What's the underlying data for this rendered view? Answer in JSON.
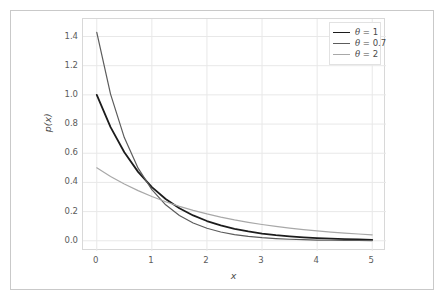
{
  "chart_data": {
    "type": "line",
    "title": "",
    "subtitle": "",
    "xlabel": "x",
    "ylabel": "p(x)",
    "xlim": [
      -0.25,
      5.25
    ],
    "ylim": [
      -0.07,
      1.52
    ],
    "xticks": [
      "0",
      "1",
      "2",
      "3",
      "4",
      "5"
    ],
    "xtick_values": [
      0,
      1,
      2,
      3,
      4,
      5
    ],
    "yticks": [
      "0.0",
      "0.2",
      "0.4",
      "0.6",
      "0.8",
      "1.0",
      "1.2",
      "1.4"
    ],
    "ytick_values": [
      0.0,
      0.2,
      0.4,
      0.6,
      0.8,
      1.0,
      1.2,
      1.4
    ],
    "grid": true,
    "grid_color": "#e8e8e8",
    "legend_position": "upper right",
    "x": [
      0,
      0.25,
      0.5,
      0.75,
      1,
      1.25,
      1.5,
      1.75,
      2,
      2.25,
      2.5,
      2.75,
      3,
      3.25,
      3.5,
      3.75,
      4,
      4.25,
      4.5,
      4.75,
      5
    ],
    "series": [
      {
        "name": "theta-1",
        "legend_label": "θ = 1",
        "color": "#1c1c1c",
        "linewidth": 1.8,
        "values": [
          1.0,
          0.7788,
          0.6065,
          0.4724,
          0.3679,
          0.2865,
          0.2231,
          0.1738,
          0.1353,
          0.1054,
          0.0821,
          0.0639,
          0.0498,
          0.0388,
          0.0302,
          0.0235,
          0.0183,
          0.0143,
          0.0111,
          0.0087,
          0.0067
        ]
      },
      {
        "name": "theta-0.7",
        "legend_label": "θ = 0.7",
        "color": "#5c5c5c",
        "linewidth": 1.2,
        "values": [
          1.4286,
          1.0052,
          0.7073,
          0.4977,
          0.3502,
          0.2464,
          0.1734,
          0.122,
          0.0858,
          0.0604,
          0.0425,
          0.0299,
          0.021,
          0.0148,
          0.0104,
          0.0073,
          0.0052,
          0.0036,
          0.0026,
          0.0018,
          0.0013
        ]
      },
      {
        "name": "theta-2",
        "legend_label": "θ = 2",
        "color": "#a8a8a8",
        "linewidth": 1.2,
        "values": [
          0.5,
          0.4412,
          0.3894,
          0.3436,
          0.3033,
          0.2676,
          0.2362,
          0.2084,
          0.1839,
          0.1623,
          0.1433,
          0.1264,
          0.1116,
          0.0985,
          0.0869,
          0.0767,
          0.0677,
          0.0597,
          0.0527,
          0.0465,
          0.041
        ]
      }
    ]
  },
  "legend": {
    "items": [
      {
        "label": "θ = 1",
        "theta": "θ",
        "rest": " = 1"
      },
      {
        "label": "θ = 0.7",
        "theta": "θ",
        "rest": " = 0.7"
      },
      {
        "label": "θ = 2",
        "theta": "θ",
        "rest": " = 2"
      }
    ]
  },
  "colors": {
    "background": "#ffffff",
    "frame_border": "#c9c9c9",
    "axes_border": "#d8d8d8",
    "grid": "#e8e8e8",
    "tick_text": "#5b5b5b",
    "axis_label_text": "#4a4a4a"
  }
}
